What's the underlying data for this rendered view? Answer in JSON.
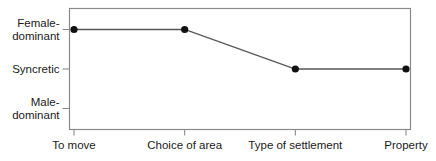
{
  "chart_data": {
    "type": "line",
    "title": "",
    "xlabel": "",
    "ylabel": "",
    "categories": [
      "To move",
      "Choice of area",
      "Type of settlement",
      "Property"
    ],
    "y_levels": [
      {
        "value": 3,
        "label_lines": [
          "Female-",
          "dominant"
        ],
        "label": "Female-dominant"
      },
      {
        "value": 2,
        "label_lines": [
          "Syncretic"
        ],
        "label": "Syncretic"
      },
      {
        "value": 1,
        "label_lines": [
          "Male-",
          "dominant"
        ],
        "label": "Male-dominant"
      }
    ],
    "series": [
      {
        "name": "Decision dominance",
        "values": [
          3,
          3,
          2,
          2
        ],
        "value_labels": [
          "Female-dominant",
          "Female-dominant",
          "Syncretic",
          "Syncretic"
        ],
        "color": "#555555",
        "marker_color": "#111111"
      }
    ],
    "ylim": [
      0.85,
      3.55
    ],
    "grid": false,
    "legend": "none"
  },
  "colors": {
    "frame": "#8a8a8a",
    "line": "#555555",
    "marker": "#111111",
    "text": "#1a1a1a"
  }
}
